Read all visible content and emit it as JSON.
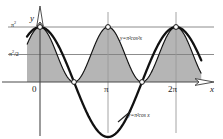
{
  "figure": {
    "background_color": "#ffffff",
    "fill_color": "#b5b5b5",
    "curve_color": "#111111",
    "axis_color": "#4a4a4a",
    "gridline_color": "#8a8a8a"
  },
  "axes": {
    "y_axis_label": "y",
    "x_axis_label": "x",
    "origin_label": "0",
    "y_ticks": [
      {
        "label_html": "π²",
        "value": "pi^2"
      },
      {
        "label_html": "π²/2",
        "value": "pi^2/2"
      }
    ],
    "x_ticks": [
      {
        "label": "0",
        "value": 0
      },
      {
        "label": "π",
        "value": 3.14159
      },
      {
        "label": "2π",
        "value": 6.28318
      }
    ],
    "xlim": [
      -0.6,
      7.5
    ],
    "ylim": [
      -12.5,
      12.5
    ]
  },
  "curves": [
    {
      "name": "cos-squared-curve",
      "label": "y=π²cos²x",
      "expression": "y = pi^2 * cos(x)^2",
      "amplitude": 9.8696,
      "filled": true,
      "fill_color": "#b5b5b5",
      "stroke_color": "#111111",
      "stroke_width": 1.1
    },
    {
      "name": "cos-curve",
      "label": "y=π²cos x",
      "expression": "y = pi^2 * cos(x)",
      "amplitude": 9.8696,
      "filled": false,
      "stroke_color": "#111111",
      "stroke_width": 2.2
    }
  ],
  "gridlines": [
    {
      "name": "hline-pi-squared",
      "y_value": 9.8696,
      "orientation": "horizontal"
    },
    {
      "name": "hline-half-pi-squared",
      "y_value": 4.9348,
      "orientation": "horizontal"
    },
    {
      "name": "vline-zero",
      "x_value": 0,
      "orientation": "vertical"
    },
    {
      "name": "vline-pi",
      "x_value": 3.14159,
      "orientation": "vertical"
    },
    {
      "name": "vline-two-pi",
      "x_value": 6.28318,
      "orientation": "vertical"
    }
  ],
  "markers": [
    {
      "name": "peak-at-0",
      "x": 0,
      "y": 9.8696,
      "style": "open-circle"
    },
    {
      "name": "peak-at-pi",
      "x": 3.14159,
      "y": 9.8696,
      "style": "open-circle"
    },
    {
      "name": "peak-at-two-pi",
      "x": 6.28318,
      "y": 9.8696,
      "style": "open-circle"
    },
    {
      "name": "zero-at-half-pi",
      "x": 1.5708,
      "y": 0,
      "style": "open-circle"
    },
    {
      "name": "zero-at-three-half-pi",
      "x": 4.71239,
      "y": 0,
      "style": "open-circle"
    }
  ]
}
